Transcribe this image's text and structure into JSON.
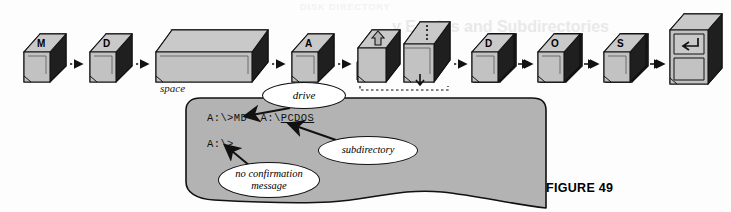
{
  "figure": {
    "caption": "FIGURE 49"
  },
  "keyboard": {
    "space_label": "space",
    "keys": [
      {
        "id": "key-m",
        "label": "M",
        "type": "letter",
        "x": 24,
        "w": 42,
        "h": 52
      },
      {
        "id": "key-d1",
        "label": "D",
        "type": "letter",
        "x": 84,
        "w": 42,
        "h": 52
      },
      {
        "id": "key-space",
        "label": "",
        "type": "space",
        "x": 144,
        "w": 116,
        "h": 52
      },
      {
        "id": "key-a",
        "label": "A",
        "type": "letter",
        "x": 278,
        "w": 42,
        "h": 52
      },
      {
        "id": "key-shift",
        "label": "",
        "type": "shift",
        "x": 330,
        "w": 52,
        "h": 58
      },
      {
        "id": "key-colon",
        "label": ":",
        "type": "colon",
        "x": 384,
        "w": 44,
        "h": 62
      },
      {
        "id": "key-backslash",
        "label": "\\",
        "type": "backslash",
        "x": 442,
        "w": 42,
        "h": 52
      },
      {
        "id": "key-p",
        "label": "P",
        "type": "letter",
        "x": 500,
        "w": 42,
        "h": 52
      },
      {
        "id": "key-c",
        "label": "C",
        "type": "letter",
        "x": 558,
        "w": 42,
        "h": 52
      },
      {
        "id": "key-d2",
        "label": "D",
        "type": "letter",
        "x": 616,
        "w": 42,
        "h": 52
      },
      {
        "id": "key-o",
        "label": "O",
        "type": "letter",
        "x": 674,
        "w": 42,
        "h": 52
      },
      {
        "id": "key-s",
        "label": "S",
        "type": "letter",
        "x": 732,
        "w": 42,
        "h": 52
      },
      {
        "id": "key-enter",
        "label": "↵",
        "type": "enter",
        "x": 790,
        "w": 48,
        "h": 78
      }
    ],
    "sequence_order": [
      "M",
      "D",
      "space",
      "A",
      "Shift",
      ":",
      "\\",
      "P",
      "C",
      "D",
      "O",
      "S",
      "Enter"
    ]
  },
  "screen": {
    "command_prompt": "A:\\>MD  A:\\",
    "command_argument": "PCDOS",
    "result_prompt": "A:\\>"
  },
  "callouts": {
    "drive": "drive",
    "subdirectory": "subdirectory",
    "no_confirmation_line1": "no confirmation",
    "no_confirmation_line2": "message"
  },
  "ghost_text": {
    "line1": "y Entries and Subdirectories",
    "line2": "the sample lines below",
    "line3": "DISK DIRECTORY"
  },
  "colors": {
    "key_face": "#bdbdbd",
    "key_top": "#c9c9c9",
    "key_side_dark": "#1c1c1c",
    "key_outline": "#111111",
    "screen_fill": "#b3b3b3",
    "screen_outline": "#111111",
    "callout_fill": "#ffffff",
    "page_bg": "#fdfdfd"
  }
}
